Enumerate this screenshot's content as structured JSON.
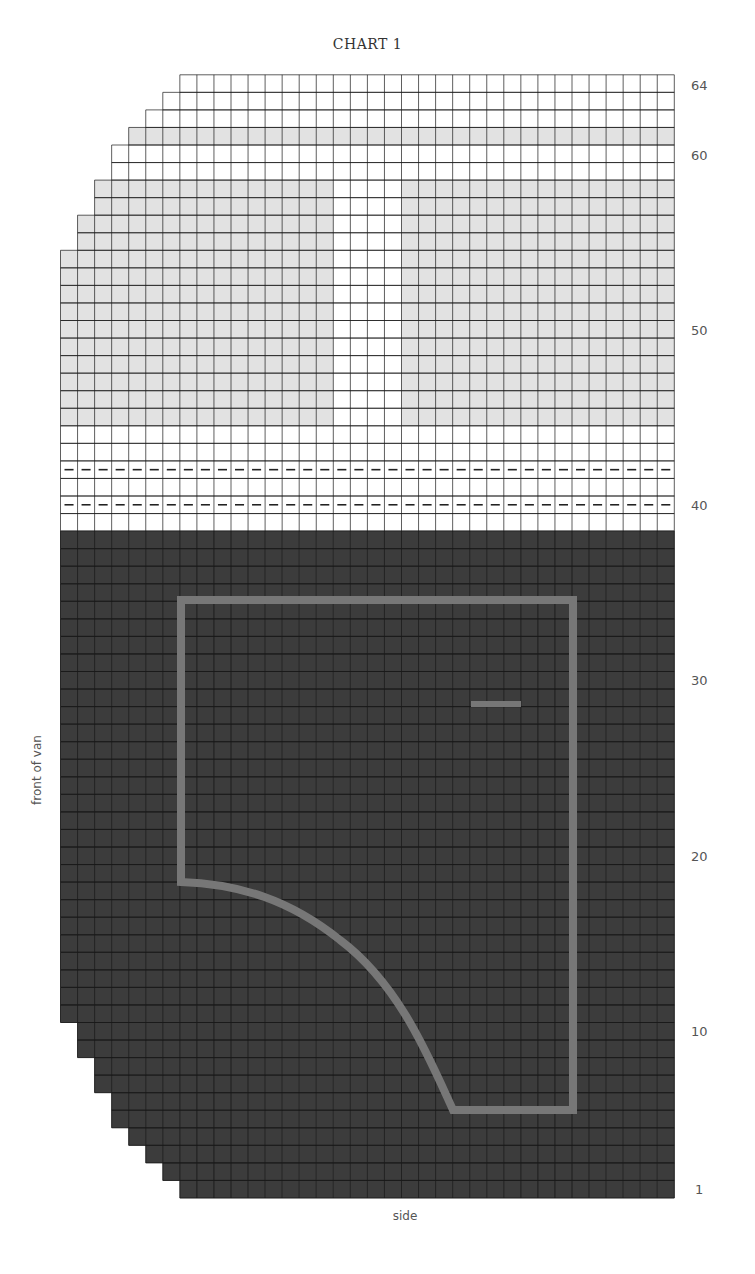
{
  "chart_data": {
    "type": "heatmap",
    "title": "CHART 1",
    "xlabel": "side",
    "ylabel": "front of van",
    "rows": 64,
    "columns": 36,
    "row_tick_labels": [
      "1",
      "10",
      "20",
      "30",
      "40",
      "50",
      "60",
      "64"
    ],
    "row_ticks": [
      1,
      10,
      20,
      30,
      40,
      50,
      60,
      64
    ],
    "row_left_offsets": {
      "1": 7,
      "2": 6,
      "3": 5,
      "4": 4,
      "5": 3,
      "6": 3,
      "7": 2,
      "8": 2,
      "9": 1,
      "10": 1,
      "55": 1,
      "56": 1,
      "57": 2,
      "58": 2,
      "59": 3,
      "60": 3,
      "61": 4,
      "62": 5,
      "63": 6,
      "64": 7
    },
    "colors": {
      "dark": "#3c3c3c",
      "light_gray": "#e2e2e2",
      "white": "#ffffff",
      "outline": "#777777",
      "gridline": "#1a1a1a"
    },
    "bands": [
      {
        "name": "dark body",
        "rows": [
          1,
          38
        ],
        "fill": "dark"
      },
      {
        "name": "white rows",
        "rows": [
          39,
          44
        ],
        "fill": "white"
      },
      {
        "name": "light gray band",
        "rows": [
          45,
          58
        ],
        "fill": "light_gray",
        "white_columns": [
          16,
          17,
          18,
          19
        ]
      },
      {
        "name": "white rows",
        "rows": [
          59,
          60
        ],
        "fill": "white"
      },
      {
        "name": "light gray row",
        "rows": [
          61,
          61
        ],
        "fill": "light_gray"
      },
      {
        "name": "white rows",
        "rows": [
          62,
          64
        ],
        "fill": "white"
      }
    ],
    "dashed_rows": [
      40,
      42
    ],
    "outline_shape": {
      "description": "window/door outline on dark body with curved lower-left edge",
      "color": "outline"
    },
    "short_bar": {
      "description": "short horizontal bar (handle)",
      "row": 29
    }
  },
  "labels": {
    "title": "CHART 1",
    "x_axis": "side",
    "y_axis": "front of van",
    "row_64": "64",
    "row_60": "60",
    "row_50": "50",
    "row_40": "40",
    "row_30": "30",
    "row_20": "20",
    "row_10": "10",
    "row_1": "1"
  }
}
